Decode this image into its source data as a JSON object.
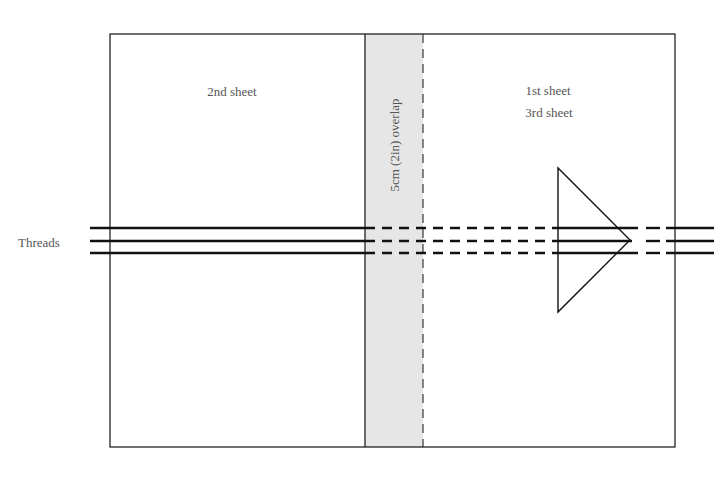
{
  "diagram": {
    "labels": {
      "left_sheet": "2nd sheet",
      "right_sheet_line1": "1st sheet",
      "right_sheet_line2": "3rd sheet",
      "overlap": "5cm (2in) overlap",
      "threads": "Threads"
    },
    "colors": {
      "stroke": "#111111",
      "overlap_fill": "#e6e6e6",
      "text": "#555555"
    },
    "shapes": {
      "outer_rect": {
        "x": 110,
        "y": 34,
        "w": 565,
        "h": 413
      },
      "overlap_strip": {
        "x1": 365,
        "x2": 423
      },
      "thread_y": [
        228,
        241,
        253
      ],
      "triangle": [
        [
          558,
          168
        ],
        [
          558,
          312
        ],
        [
          630,
          240
        ]
      ]
    }
  }
}
